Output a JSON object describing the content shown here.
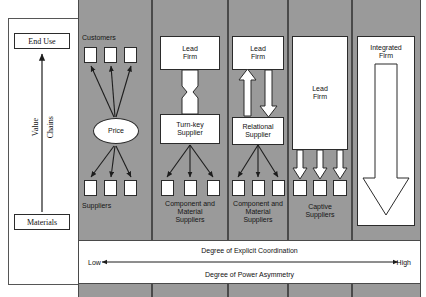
{
  "diagram": {
    "columns": [
      {
        "key": "market",
        "label": "Market"
      },
      {
        "key": "modular",
        "label": "Modular"
      },
      {
        "key": "relational",
        "label": "Relational"
      },
      {
        "key": "captive",
        "label": "Captive"
      },
      {
        "key": "hierarchy",
        "label": "Hierarchy"
      }
    ],
    "value_chain_axis": {
      "top_label": "End Use",
      "bottom_label": "Materials",
      "side_label_left": "Value",
      "side_label_right": "Chains"
    },
    "market": {
      "customers_label": "Customers",
      "price_label": "Price",
      "suppliers_label": "Suppliers",
      "customer_count": 3,
      "supplier_count": 3
    },
    "modular": {
      "lead_firm_label": "Lead\nFirm",
      "lead_firm_line1": "Lead",
      "lead_firm_line2": "Firm",
      "turnkey_line1": "Turn-key",
      "turnkey_line2": "Supplier",
      "suppliers_line1": "Component and",
      "suppliers_line2": "Material",
      "suppliers_line3": "Suppliers",
      "supplier_count": 3
    },
    "relational": {
      "lead_firm_line1": "Lead",
      "lead_firm_line2": "Firm",
      "supplier_line1": "Relational",
      "supplier_line2": "Supplier",
      "suppliers_line1": "Component and",
      "suppliers_line2": "Material",
      "suppliers_line3": "Suppliers",
      "supplier_count": 3
    },
    "captive": {
      "lead_firm_line1": "Lead",
      "lead_firm_line2": "Firm",
      "suppliers_line1": "Captive",
      "suppliers_line2": "Suppliers",
      "supplier_count": 3
    },
    "hierarchy": {
      "integrated_line1": "Integrated",
      "integrated_line2": "Firm"
    },
    "legend": {
      "top_text": "Degree of Explicit Coordination",
      "bottom_text": "Degree of Power Asymmetry",
      "left_end": "Low",
      "right_end": "High"
    },
    "colors": {
      "panel_gray": "#9a9a9a",
      "line": "#2b2b2b",
      "box_fill": "#ffffff",
      "frame": "#565656"
    }
  }
}
